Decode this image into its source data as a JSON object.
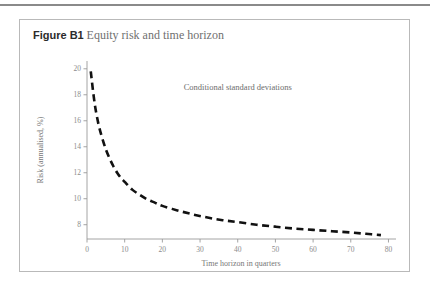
{
  "page": {
    "rule_color": "#8a8a8a"
  },
  "figure": {
    "label": "Figure B1",
    "title": "Equity risk and time horizon",
    "border_color": "#b9b9b9"
  },
  "chart_data": {
    "type": "line",
    "title": "Equity risk and time horizon",
    "xlabel": "Time horizon in quarters",
    "ylabel": "Risk (annualised, %)",
    "xlim": [
      0,
      82
    ],
    "ylim": [
      6.9,
      20.6
    ],
    "xticks": [
      0,
      10,
      20,
      30,
      40,
      50,
      60,
      70,
      80
    ],
    "yticks": [
      8,
      10,
      12,
      14,
      16,
      18,
      20
    ],
    "grid": false,
    "legend": "none",
    "annotations": [
      {
        "text": "Conditional standard deviations",
        "x": 40,
        "y": 18.4
      }
    ],
    "series": [
      {
        "name": "Conditional standard deviations",
        "style": "dashed",
        "color": "#111111",
        "x": [
          1,
          2,
          3,
          4,
          5,
          6,
          7,
          8,
          9,
          10,
          12,
          14,
          16,
          18,
          20,
          24,
          28,
          32,
          36,
          40,
          45,
          50,
          55,
          60,
          65,
          70,
          74,
          78
        ],
        "values": [
          19.8,
          17.4,
          15.8,
          14.7,
          13.8,
          13.1,
          12.5,
          12.0,
          11.6,
          11.3,
          10.7,
          10.3,
          9.95,
          9.7,
          9.45,
          9.1,
          8.8,
          8.55,
          8.35,
          8.2,
          8.0,
          7.85,
          7.7,
          7.6,
          7.5,
          7.4,
          7.3,
          7.2
        ]
      }
    ]
  }
}
